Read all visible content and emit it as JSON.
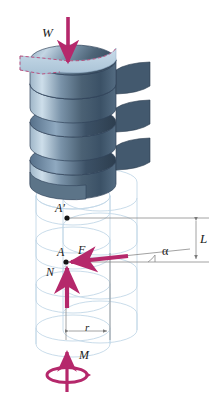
{
  "figure": {
    "name": "square-threaded-screw-free-body-diagram",
    "background": "#ffffff"
  },
  "colors": {
    "force_arrow": "#b5286b",
    "load_arrow": "#b5286b",
    "thread_dark": "#3d5268",
    "thread_mid": "#5d768e",
    "thread_light": "#9fb4c6",
    "thread_highlight": "#c9dbe8",
    "top_face": "#b9d2e8",
    "dashed_outline": "#c0396b",
    "ghost_outline": "#bcd3e4",
    "dimension_line": "#888888",
    "text": "#1a1a1a"
  },
  "labels": {
    "load": "W",
    "point_upper": "A'",
    "point_lower": "A",
    "friction_force": "F",
    "normal_force": "N",
    "moment": "M",
    "lead": "L",
    "radius": "r",
    "helix_angle": "α"
  },
  "annotations": {
    "load_description": "axial load W applied downward on top of screw",
    "reaction_description": "reaction force F and normal force N acting at point A on the thread",
    "moment_description": "applied torque M about the screw axis",
    "lead_description": "L is the lead (axial advance per revolution) between A and A'",
    "radius_description": "r is the mean radius of the thread",
    "angle_description": "alpha is the helix (lead) angle of the unwrapped thread"
  },
  "geometry": {
    "point_A_upper": {
      "x": 67,
      "y": 218
    },
    "point_A_lower": {
      "x": 66,
      "y": 262
    },
    "lead_dimension": {
      "x": 196,
      "y_top": 218,
      "y_bottom": 262
    },
    "radius_dimension": {
      "y": 331,
      "x_left": 66,
      "x_right": 110
    },
    "helix_turns": 4,
    "ghost_turns": 4
  }
}
